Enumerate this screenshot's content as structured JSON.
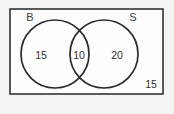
{
  "diagram": {
    "type": "venn-diagram",
    "title": "",
    "universe": {
      "label": "",
      "outside_count": "15",
      "border_color": "#333333",
      "fill_color": "#fdfdfd"
    },
    "background_color": "#f4f4f4",
    "stroke_color": "#2a2a2a",
    "text_color": "#2e2e2e",
    "sets": [
      {
        "name": "set-b",
        "label": "B",
        "only_count": "15",
        "label_x": 30,
        "label_y": 18,
        "circle_cx": 55,
        "circle_cy": 54,
        "circle_r": 34,
        "count_x": 41,
        "count_y": 56
      },
      {
        "name": "set-s",
        "label": "S",
        "only_count": "20",
        "label_x": 133,
        "label_y": 18,
        "circle_cx": 104,
        "circle_cy": 54,
        "circle_r": 34,
        "count_x": 117,
        "count_y": 56
      }
    ],
    "intersection": {
      "label": "B and S",
      "count": "10",
      "count_x": 79,
      "count_y": 56
    },
    "outside": {
      "count_x": 151,
      "count_y": 85
    },
    "rect": {
      "x": 10,
      "y": 9,
      "width": 153,
      "height": 85
    }
  }
}
